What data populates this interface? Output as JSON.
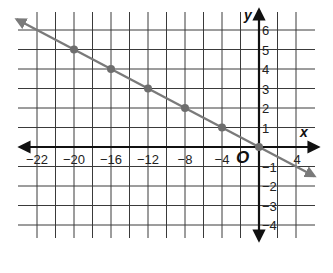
{
  "chart_data": {
    "type": "line",
    "title": "",
    "xlabel": "x",
    "ylabel": "y",
    "origin_label": "O",
    "x_tick_labels": [
      "−22",
      "−20",
      "−16",
      "−12",
      "−8",
      "−4",
      "4"
    ],
    "y_tick_labels": [
      "6",
      "5",
      "4",
      "3",
      "2",
      "1",
      "−1",
      "−2",
      "−3",
      "−4"
    ],
    "xlim": [
      -24,
      6
    ],
    "ylim": [
      -5,
      7
    ],
    "grid": true,
    "series": [
      {
        "name": "line",
        "x": [
          -20,
          -16,
          -12,
          -8,
          -4,
          0
        ],
        "y": [
          5,
          4,
          3,
          2,
          1,
          0
        ],
        "equation": "y = -x/4",
        "arrows_both_ends": true,
        "color": "#7a7a7a"
      }
    ]
  },
  "colors": {
    "grid": "#3a3a3a",
    "axis": "#111111",
    "line": "#7a7a7a",
    "point": "#6e6e6e"
  }
}
